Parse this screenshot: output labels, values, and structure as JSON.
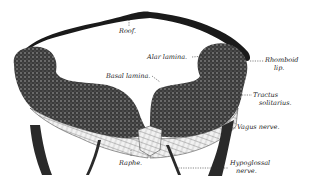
{
  "figure": {
    "colors": {
      "ink": "#1a1a1a",
      "background": "#ffffff"
    }
  },
  "labels": {
    "roof": "Roof.",
    "alar_lamina": "Alar lamina.",
    "basal_lamina": "Basal lamina.",
    "rhomboid_lip_1": "Rhomboid",
    "rhomboid_lip_2": "lip.",
    "tractus_1": "Tractus",
    "tractus_2": "solitarius.",
    "vagus": "Vagus nerve.",
    "raphe": "Raphe.",
    "hypoglossal_1": "Hypoglossal",
    "hypoglossal_2": "nerve."
  }
}
